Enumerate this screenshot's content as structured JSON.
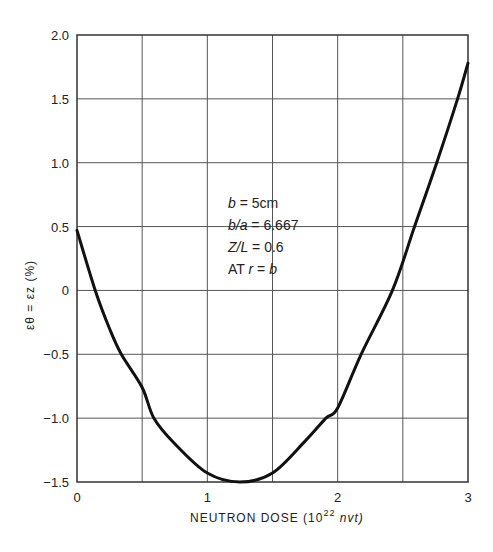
{
  "chart_data": {
    "type": "line",
    "title": "",
    "xlabel": "NEUTRON DOSE",
    "xlabel_unit_prefix": "(10",
    "xlabel_unit_exp": "22",
    "xlabel_unit_suffix": "nvt)",
    "ylabel": "εθ = εz (%)",
    "xlim": [
      0,
      3
    ],
    "ylim": [
      -1.5,
      2.0
    ],
    "grid": true,
    "x_grid_step": 0.5,
    "y_grid_step": 0.5,
    "x_ticks": [
      "0",
      "1",
      "2",
      "3"
    ],
    "x_tick_values": [
      0,
      1,
      2,
      3
    ],
    "y_ticks": [
      "2.0",
      "1.5",
      "1.0",
      "0.5",
      "0",
      "−0.5",
      "−1.0",
      "−1.5"
    ],
    "y_tick_values": [
      2.0,
      1.5,
      1.0,
      0.5,
      0,
      -0.5,
      -1.0,
      -1.5
    ],
    "annotation": [
      "b = 5cm",
      "b/a = 6.667",
      "Z/L = 0.6",
      "AT  r = b"
    ],
    "series": [
      {
        "name": "strain",
        "x": [
          0,
          0.14,
          0.25,
          0.34,
          0.5,
          0.59,
          0.75,
          1.0,
          1.25,
          1.5,
          1.75,
          1.91,
          2.0,
          2.18,
          2.42,
          2.59,
          2.76,
          2.92,
          3.0
        ],
        "values": [
          0.47,
          0,
          -0.3,
          -0.5,
          -0.76,
          -1.0,
          -1.2,
          -1.43,
          -1.5,
          -1.43,
          -1.18,
          -1.0,
          -0.92,
          -0.5,
          0,
          0.5,
          1.0,
          1.5,
          1.78
        ]
      }
    ]
  }
}
